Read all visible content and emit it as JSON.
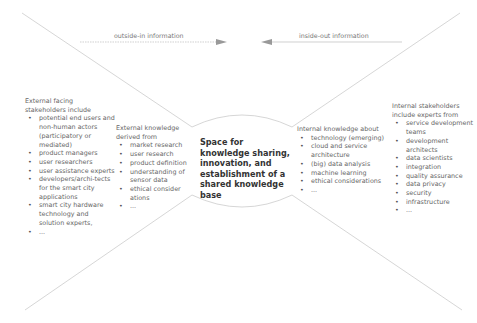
{
  "arrows": {
    "outside_in": "outside-in information",
    "inside_out": "inside-out information"
  },
  "external_stakeholders": {
    "intro": "External facing stakeholders include",
    "items": [
      "potential end users and non-human actors (participatory or mediated)",
      "product managers",
      "user researchers",
      "user assistance experts",
      "developers/archi-tects for the smart city applications",
      "smart city hardware technology and solution experts,",
      "..."
    ]
  },
  "external_knowledge": {
    "intro": "External knowledge derived from",
    "items": [
      "market research",
      "user research",
      "product definition",
      "understanding of sensor data",
      "ethical consider ations",
      "..."
    ]
  },
  "center": {
    "text": "Space for knowledge sharing, innovation, and establishment of a shared knowledge base"
  },
  "internal_knowledge": {
    "intro": "Internal knowledge about",
    "items": [
      "technology (emerging)",
      "cloud and service architecture",
      "(big) data analysis",
      "machine learning",
      "ethical considerations",
      "..."
    ]
  },
  "internal_stakeholders": {
    "intro": "Internal stakeholders include experts from",
    "items": [
      "service development teams",
      "development architects",
      "data scientists",
      "integration",
      "quality assurance",
      "data privacy",
      "security",
      "infrastructure",
      "..."
    ]
  },
  "colors": {
    "line": "#c8c8c8",
    "arrow": "#999999",
    "text": "#666666",
    "center_text": "#333333"
  }
}
